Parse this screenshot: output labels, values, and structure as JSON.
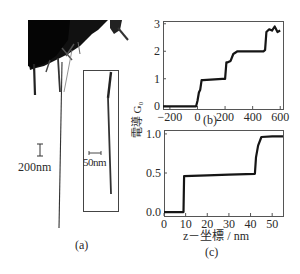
{
  "figure": {
    "panel_a": {
      "label": "(a)",
      "scale_bar_main": "200nm",
      "scale_bar_inset": "50nm"
    },
    "panel_b": {
      "label": "(b)"
    },
    "panel_c": {
      "label": "(c)"
    },
    "shared_ylabel": "電導 G₀",
    "c_xlabel": "z－坐標 / nm"
  },
  "chart_data": [
    {
      "type": "line",
      "panel": "(b)",
      "title": "",
      "xlabel": "",
      "ylabel": "電導 G₀",
      "xlim": [
        -250,
        620
      ],
      "ylim": [
        -0.1,
        3.1
      ],
      "xticks": [
        -200,
        0,
        200,
        400,
        600
      ],
      "yticks": [
        0,
        1,
        2,
        3
      ],
      "grid": false,
      "series": [
        {
          "name": "conductance",
          "x": [
            -250,
            -10,
            0,
            10,
            20,
            30,
            40,
            180,
            200,
            210,
            220,
            240,
            260,
            290,
            480,
            490,
            500,
            520,
            540,
            560,
            580,
            600
          ],
          "y": [
            0.0,
            0.0,
            0.2,
            0.5,
            0.6,
            0.95,
            0.95,
            1.0,
            1.0,
            1.6,
            1.6,
            1.65,
            1.9,
            2.0,
            2.0,
            2.05,
            2.7,
            2.8,
            2.75,
            2.9,
            2.7,
            2.75
          ]
        }
      ]
    },
    {
      "type": "line",
      "panel": "(c)",
      "title": "",
      "xlabel": "z－坐標 / nm",
      "ylabel": "電導 G₀",
      "xlim": [
        0,
        55
      ],
      "ylim": [
        -0.05,
        1.05
      ],
      "xticks": [
        0,
        10,
        20,
        30,
        40,
        50
      ],
      "yticks": [
        0.0,
        0.5,
        1.0
      ],
      "ytick_labels": [
        "0.0",
        "0.5",
        "1.0"
      ],
      "grid": false,
      "series": [
        {
          "name": "conductance",
          "x": [
            0,
            9,
            9.3,
            20,
            30,
            42,
            42.5,
            43.5,
            45,
            50,
            55
          ],
          "y": [
            0.0,
            0.0,
            0.46,
            0.47,
            0.48,
            0.49,
            0.7,
            0.85,
            0.96,
            0.97,
            0.97
          ]
        }
      ]
    }
  ]
}
